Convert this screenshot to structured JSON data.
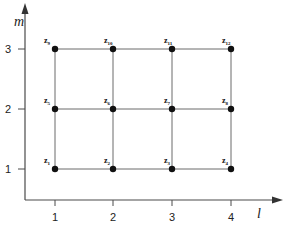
{
  "diagram": {
    "axes": {
      "x_label": "l",
      "y_label": "m",
      "x_ticks": [
        "1",
        "2",
        "3",
        "4"
      ],
      "y_ticks": [
        "1",
        "2",
        "3"
      ]
    },
    "nodes": [
      {
        "id": "z1",
        "base": "z",
        "sub": "1",
        "l": 1,
        "m": 1
      },
      {
        "id": "z2",
        "base": "z",
        "sub": "2",
        "l": 2,
        "m": 1
      },
      {
        "id": "z3",
        "base": "z",
        "sub": "3",
        "l": 3,
        "m": 1
      },
      {
        "id": "z4",
        "base": "z",
        "sub": "4",
        "l": 4,
        "m": 1
      },
      {
        "id": "z5",
        "base": "z",
        "sub": "5",
        "l": 1,
        "m": 2
      },
      {
        "id": "z6",
        "base": "z",
        "sub": "6",
        "l": 2,
        "m": 2
      },
      {
        "id": "z7",
        "base": "z",
        "sub": "7",
        "l": 3,
        "m": 2
      },
      {
        "id": "z8",
        "base": "z",
        "sub": "8",
        "l": 4,
        "m": 2
      },
      {
        "id": "z9",
        "base": "z",
        "sub": "9",
        "l": 1,
        "m": 3
      },
      {
        "id": "z10",
        "base": "z",
        "sub": "10",
        "l": 2,
        "m": 3
      },
      {
        "id": "z11",
        "base": "z",
        "sub": "11",
        "l": 3,
        "m": 3
      },
      {
        "id": "z12",
        "base": "z",
        "sub": "12",
        "l": 4,
        "m": 3
      }
    ],
    "colors": {
      "axis": "#4a4a4a",
      "grid": "#6a6a6a",
      "node": "#111111"
    }
  }
}
